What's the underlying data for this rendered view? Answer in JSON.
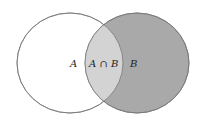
{
  "diagram": {
    "type": "venn",
    "sets": [
      {
        "id": "A",
        "label": "A",
        "fill": "#ffffff"
      },
      {
        "id": "B",
        "label": "B",
        "fill": "#a9a9a9"
      }
    ],
    "intersection": {
      "label": "A ∩ B",
      "fill": "#d3d3d3"
    },
    "stroke": "#777777"
  }
}
